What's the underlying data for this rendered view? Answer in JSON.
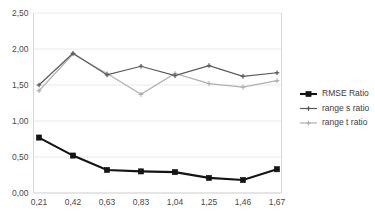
{
  "chart_data": {
    "type": "line",
    "title": "",
    "subtitle": "",
    "xlabel": "",
    "ylabel": "",
    "categories": [
      "0,21",
      "0,42",
      "0,63",
      "0,83",
      "1,04",
      "1,25",
      "1,46",
      "1,67"
    ],
    "x_tick_labels": [
      "0,21",
      "0,42",
      "0,63",
      "0,83",
      "1,04",
      "1,25",
      "1,46",
      "1,67"
    ],
    "y_tick_labels": [
      "0,00",
      "0,50",
      "1,00",
      "1,50",
      "2,00",
      "2,50"
    ],
    "y_tick_values": [
      0.0,
      0.5,
      1.0,
      1.5,
      2.0,
      2.5
    ],
    "ylim": [
      0.0,
      2.5
    ],
    "grid": "horizontal",
    "legend_position": "right",
    "series": [
      {
        "name": "RMSE Ratio",
        "color": "#141414",
        "marker": "square",
        "line_width": 2.1,
        "marker_size": 5.2,
        "values": [
          0.77,
          0.52,
          0.32,
          0.3,
          0.29,
          0.21,
          0.18,
          0.33
        ]
      },
      {
        "name": "range s ratio",
        "color": "#5a5a5a",
        "marker": "plus",
        "line_width": 1.2,
        "marker_size": 3.4,
        "values": [
          1.5,
          1.94,
          1.64,
          1.76,
          1.63,
          1.77,
          1.62,
          1.67
        ]
      },
      {
        "name": "range t ratio",
        "color": "#b0b0b0",
        "marker": "plus",
        "line_width": 1.2,
        "marker_size": 3.4,
        "values": [
          1.42,
          1.93,
          1.66,
          1.37,
          1.66,
          1.52,
          1.47,
          1.56
        ]
      }
    ],
    "legend_entries": [
      {
        "label": "RMSE Ratio",
        "color": "#141414",
        "marker": "square"
      },
      {
        "label": "range s ratio",
        "color": "#5a5a5a",
        "marker": "plus"
      },
      {
        "label": "range t ratio",
        "color": "#b0b0b0",
        "marker": "plus"
      }
    ],
    "colors": {
      "background": "#ffffff",
      "gridline": "#e3e3e3",
      "axis": "#d2d2d2",
      "tick_text": "#4a4a4a",
      "legend_text": "#3c3c3c"
    }
  }
}
